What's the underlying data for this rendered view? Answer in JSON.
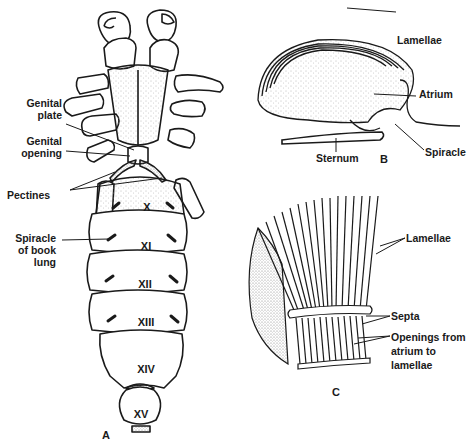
{
  "figure": {
    "panels": {
      "a": {
        "letter": "A",
        "labels": {
          "genital_plate": "Genital plate",
          "genital_plate_l1": "Genital",
          "genital_plate_l2": "plate",
          "genital_opening_l1": "Genital",
          "genital_opening_l2": "opening",
          "pectines": "Pectines",
          "spiracle_l1": "Spiracle",
          "spiracle_l2": "of book",
          "spiracle_l3": "lung"
        },
        "segments": [
          "X",
          "XI",
          "XII",
          "XIII",
          "XIV",
          "XV"
        ]
      },
      "b": {
        "letter": "B",
        "labels": {
          "lamellae": "Lamellae",
          "atrium": "Atrium",
          "spiracle": "Spiracle",
          "sternum": "Sternum"
        }
      },
      "c": {
        "letter": "C",
        "labels": {
          "lamellae": "Lamellae",
          "septa": "Septa",
          "openings_l1": "Openings from",
          "openings_l2": "atrium to",
          "openings_l3": "lamellae"
        }
      }
    },
    "colors": {
      "ink": "#1a1a1a",
      "stipple": "#9a9a9a",
      "paper": "#ffffff"
    }
  }
}
